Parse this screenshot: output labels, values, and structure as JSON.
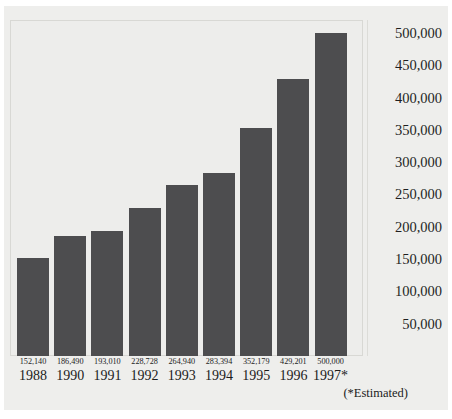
{
  "chart_data": {
    "type": "bar",
    "title": "THE GROWTH OF BRITS AT SEA",
    "xlabel": "",
    "ylabel": "",
    "categories": [
      "1988",
      "1990",
      "1991",
      "1992",
      "1993",
      "1994",
      "1995",
      "1996",
      "1997*"
    ],
    "values": [
      152140,
      186490,
      193010,
      228728,
      264940,
      283394,
      352179,
      429201,
      500000
    ],
    "value_labels": [
      "152,140",
      "186,490",
      "193,010",
      "228,728",
      "264,940",
      "283,394",
      "352,179",
      "429,201",
      "500,000"
    ],
    "ylim": [
      0,
      520000
    ],
    "yticks": [
      50000,
      100000,
      150000,
      200000,
      250000,
      300000,
      350000,
      400000,
      450000,
      500000
    ],
    "ytick_labels": [
      "50,000",
      "100,000",
      "150,000",
      "200,000",
      "250,000",
      "300,000",
      "350,000",
      "400,000",
      "450,000",
      "500,000"
    ],
    "grid": false,
    "legend": false,
    "bar_color": "#4d4d4f",
    "background_color": "#eeeeec",
    "annotation": "(*Estimated)"
  },
  "footnote": "(*Estimated)"
}
